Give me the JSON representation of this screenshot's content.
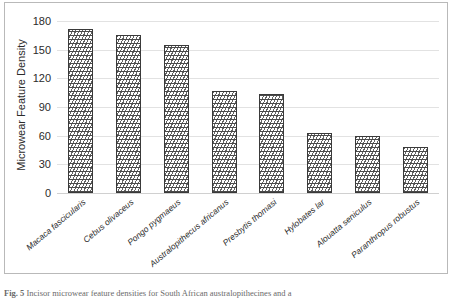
{
  "chart_data": {
    "type": "bar",
    "title": "",
    "xlabel": "",
    "ylabel": "Microwear Feature Density",
    "ylim": [
      0,
      180
    ],
    "yticks": [
      0,
      30,
      60,
      90,
      120,
      150,
      180
    ],
    "grid": true,
    "legend": "none",
    "categories": [
      "Macaca fascicularis",
      "Cebus olivaceus",
      "Pongo pygmaeus",
      "Australopithecus africanus",
      "Presbytis thomasi",
      "Hylobates lar",
      "Alouatta seniculus",
      "Paranthropus robustus"
    ],
    "values": [
      172,
      165,
      155,
      107,
      104,
      63,
      60,
      48
    ],
    "series": [
      {
        "name": "Incisor microwear feature density",
        "values": [
          172,
          165,
          155,
          107,
          104,
          63,
          60,
          48
        ]
      }
    ],
    "bar_fill": "wavy-horizontal-hatch",
    "bar_edge_color": "#3a3a3a",
    "gridline_color": "#e2e2e2",
    "frame_color": "#b9b9b9"
  },
  "caption": {
    "label": "Fig. 5",
    "text": "Incisor microwear feature densities for South African australopithecines and a"
  }
}
